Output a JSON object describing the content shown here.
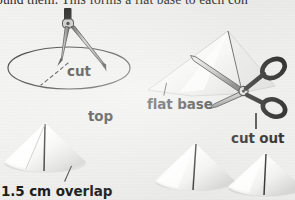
{
  "page": {
    "width": 295,
    "height": 200,
    "background_color": "#eeeeec",
    "ink_color": "#1d1d1b"
  },
  "body_text": {
    "line": "ound them.  This forms a flat base to each con"
  },
  "figure": {
    "caption_labels": [
      {
        "id": "cut",
        "text": "cut"
      },
      {
        "id": "top",
        "text": "top"
      },
      {
        "id": "overlap",
        "text": "1.5 cm overlap"
      },
      {
        "id": "flat-base",
        "text": "flat base"
      },
      {
        "id": "cut-out",
        "text": "cut out"
      }
    ],
    "illustrations": [
      {
        "id": "compass-drawing-circle",
        "name": "compass-drawing-circle-illustration"
      },
      {
        "id": "scissors-cutting-cone",
        "name": "scissors-cutting-cone-illustration"
      },
      {
        "id": "cone-left",
        "name": "cone-with-overlap-illustration"
      },
      {
        "id": "cone-middle",
        "name": "finished-cone-illustration"
      },
      {
        "id": "cone-right",
        "name": "finished-cone-illustration"
      }
    ]
  }
}
